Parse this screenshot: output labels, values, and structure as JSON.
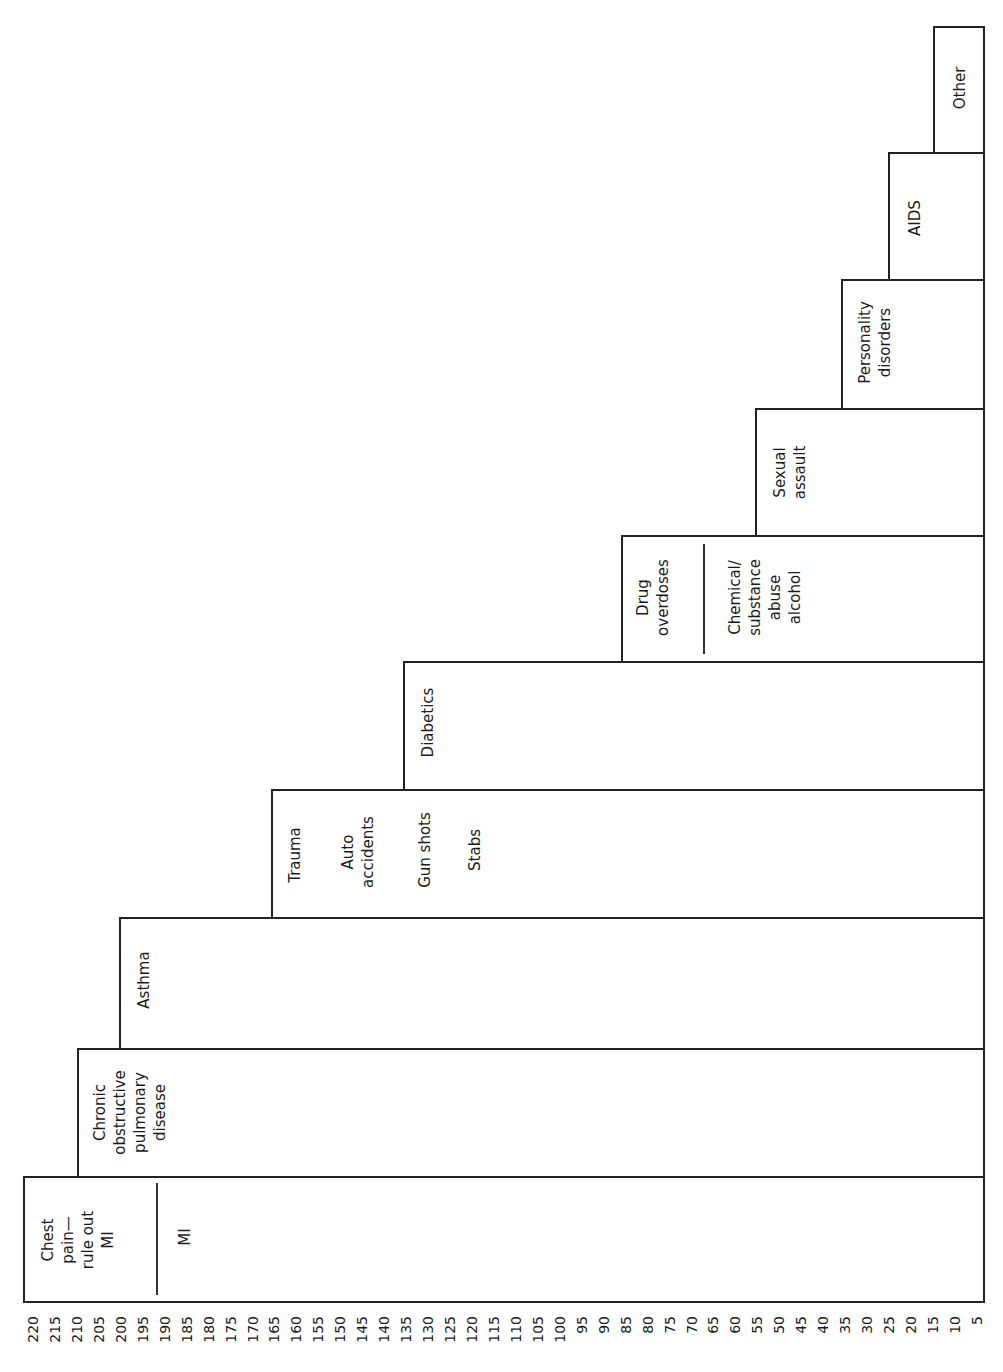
{
  "chart_data": {
    "type": "bar",
    "orientation": "rotated-step",
    "title": "",
    "xlabel": "",
    "ylabel": "",
    "axis_ticks": [
      220,
      215,
      210,
      205,
      200,
      195,
      190,
      185,
      180,
      175,
      170,
      165,
      160,
      155,
      150,
      145,
      140,
      135,
      130,
      125,
      120,
      115,
      110,
      105,
      100,
      95,
      90,
      85,
      80,
      75,
      70,
      65,
      60,
      55,
      50,
      45,
      40,
      35,
      30,
      25,
      20,
      15,
      10,
      5
    ],
    "ylim": [
      0,
      220
    ],
    "categories": [
      "Chest pain—rule out MI / MI",
      "Chronic obstructive pulmonary disease",
      "Asthma",
      "Trauma (Auto accidents, Gun shots, Stabs)",
      "Diabetics",
      "Drug overdoses / Chemical/substance abuse alcohol",
      "Sexual assault",
      "Personality disorders",
      "AIDS",
      "Other"
    ],
    "values": [
      220,
      210,
      200,
      165,
      135,
      85,
      55,
      35,
      25,
      15
    ]
  },
  "boxes": [
    {
      "main": "Chest\npain—\nrule out\nMI",
      "sub": "MI"
    },
    {
      "main": "Chronic\nobstructive\npulmonary\ndisease"
    },
    {
      "main": "Asthma"
    },
    {
      "main": "Trauma",
      "items": [
        "Auto\naccidents",
        "Gun shots",
        "Stabs"
      ]
    },
    {
      "main": "Diabetics"
    },
    {
      "main": "Drug\noverdoses",
      "sub": "Chemical/\nsubstance\nabuse\nalcohol"
    },
    {
      "main": "Sexual\nassault"
    },
    {
      "main": "Personality\ndisorders"
    },
    {
      "main": "AIDS"
    },
    {
      "main": "Other"
    }
  ],
  "ticks": [
    "220",
    "215",
    "210",
    "205",
    "200",
    "195",
    "190",
    "185",
    "180",
    "175",
    "170",
    "165",
    "160",
    "155",
    "150",
    "145",
    "140",
    "135",
    "130",
    "125",
    "120",
    "115",
    "110",
    "105",
    "100",
    "95",
    "90",
    "85",
    "80",
    "75",
    "70",
    "65",
    "60",
    "55",
    "50",
    "45",
    "40",
    "35",
    "30",
    "25",
    "20",
    "15",
    "10",
    "5"
  ]
}
